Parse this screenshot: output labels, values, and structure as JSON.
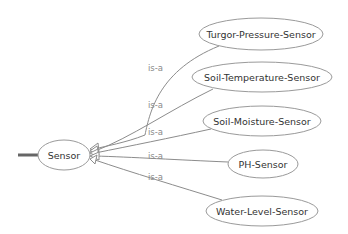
{
  "diagram": {
    "type": "class-hierarchy",
    "root": {
      "label": "Sensor",
      "cx": 64,
      "cy": 155,
      "rx": 26,
      "ry": 15
    },
    "children": [
      {
        "label": "Turgor-Pressure-Sensor",
        "cx": 261,
        "cy": 34,
        "rx": 62,
        "ry": 16
      },
      {
        "label": "Soil-Temperature-Sensor",
        "cx": 262,
        "cy": 77,
        "rx": 70,
        "ry": 15
      },
      {
        "label": "Soil-Moisture-Sensor",
        "cx": 262,
        "cy": 121,
        "rx": 59,
        "ry": 15
      },
      {
        "label": "PH-Sensor",
        "cx": 263,
        "cy": 164,
        "rx": 35,
        "ry": 14
      },
      {
        "label": "Water-Level-Sensor",
        "cx": 262,
        "cy": 211,
        "rx": 56,
        "ry": 15
      }
    ],
    "edges": [
      {
        "from": "Turgor-Pressure-Sensor",
        "to": "Sensor",
        "label": "is-a",
        "label_x": 157,
        "label_y": 68
      },
      {
        "from": "Soil-Temperature-Sensor",
        "to": "Sensor",
        "label": "is-a",
        "label_x": 157,
        "label_y": 108
      },
      {
        "from": "Soil-Moisture-Sensor",
        "to": "Sensor",
        "label": "is-a",
        "label_x": 157,
        "label_y": 134
      },
      {
        "from": "PH-Sensor",
        "to": "Sensor",
        "label": "is-a",
        "label_x": 157,
        "label_y": 158
      },
      {
        "from": "Water-Level-Sensor",
        "to": "Sensor",
        "label": "is-a",
        "label_x": 157,
        "label_y": 179
      }
    ],
    "colors": {
      "node_stroke": "#9a9a9a",
      "edge_stroke": "#8c8c8c",
      "node_text": "#333333",
      "edge_text": "#8a8a8a",
      "stub": "#666666"
    }
  }
}
